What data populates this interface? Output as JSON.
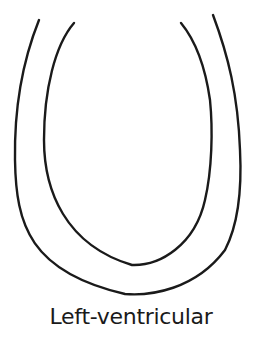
{
  "diagram": {
    "title": "Left-ventricular",
    "stroke_color": "#1a1a1a",
    "background": "#ffffff",
    "shapes": [
      {
        "name": "outer-wall",
        "description": "outer U-shaped ventricular wall outline"
      },
      {
        "name": "inner-wall",
        "description": "inner U-shaped ventricular cavity outline"
      }
    ]
  }
}
